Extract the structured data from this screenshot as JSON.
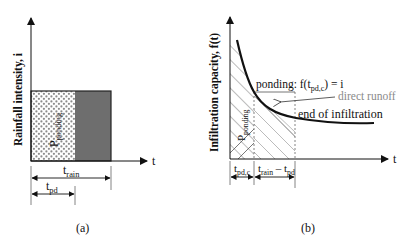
{
  "panel_a": {
    "caption": "(a)",
    "y_axis_label": "Rainfall intensity, i",
    "x_axis_label": "t",
    "area_label": {
      "main": "P",
      "sub": "ponding"
    },
    "t_rain": {
      "main": "t",
      "sub": "rain"
    },
    "t_pd": {
      "main": "t",
      "sub": "pd"
    },
    "colors": {
      "dotted_fill": "#ffffff",
      "dots": "#8c8c8c",
      "runoff_fill": "#6e6e6e",
      "outline": "#222222"
    }
  },
  "panel_b": {
    "caption": "(b)",
    "y_axis_label": "Infiltration capacity,  f(t)",
    "x_axis_label": "t",
    "area_label": {
      "main": "P",
      "sub": "ponding"
    },
    "ponding_label": {
      "prefix": "ponding: f(t",
      "sub": "pd,c",
      "suffix": ") = i"
    },
    "direct_runoff_label": "direct runoff",
    "end_label": "end of infiltration",
    "t_pdc": {
      "main": "t",
      "sub": "pd,c"
    },
    "t_rain_minus_pd": {
      "main1": "t",
      "sub1": "rain",
      "mid": " – t",
      "sub2": "pd"
    },
    "colors": {
      "curve": "#111111",
      "hatch_dark": "#555555",
      "hatch_light": "#aaaaaa",
      "runoff_text": "#8a8a8a",
      "dashed": "#666666"
    }
  }
}
